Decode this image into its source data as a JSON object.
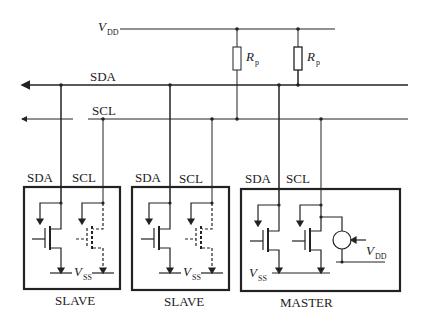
{
  "diagram": {
    "supply": {
      "symbol": "V",
      "subscript": "DD"
    },
    "pullups": [
      {
        "symbol": "R",
        "subscript": "p",
        "connects_to": "SCL"
      },
      {
        "symbol": "R",
        "subscript": "p",
        "connects_to": "SDA"
      }
    ],
    "bus_lines": [
      {
        "label": "SDA"
      },
      {
        "label": "SCL"
      }
    ],
    "devices": [
      {
        "label": "SLAVE",
        "pins": [
          "SDA",
          "SCL"
        ],
        "ground": {
          "symbol": "V",
          "subscript": "SS"
        }
      },
      {
        "label": "SLAVE",
        "pins": [
          "SDA",
          "SCL"
        ],
        "ground": {
          "symbol": "V",
          "subscript": "SS"
        }
      },
      {
        "label": "MASTER",
        "pins": [
          "SDA",
          "SCL"
        ],
        "ground": {
          "symbol": "V",
          "subscript": "SS"
        },
        "current_source_supply": {
          "symbol": "V",
          "subscript": "DD"
        }
      }
    ]
  }
}
